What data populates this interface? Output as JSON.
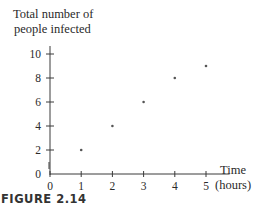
{
  "figure": {
    "caption": "FIGURE 2.14",
    "ylabel_line1": "Total number of",
    "ylabel_line2": "people infected",
    "xlabel_line1": "Time",
    "xlabel_line2": "(hours)"
  },
  "colors": {
    "axis": "#3a3a3a",
    "point": "#555555",
    "text": "#2a2a2a"
  },
  "chart_data": {
    "type": "scatter",
    "title": "",
    "xlabel": "Time (hours)",
    "ylabel": "Total number of people infected",
    "x": [
      1,
      2,
      3,
      4,
      5
    ],
    "y": [
      2,
      4,
      6,
      8,
      9
    ],
    "xticks": [
      0,
      1,
      2,
      3,
      4,
      5
    ],
    "yticks": [
      0,
      2,
      4,
      6,
      8,
      10
    ],
    "xlim": [
      0,
      5.5
    ],
    "ylim": [
      0,
      10.5
    ],
    "grid": false,
    "legend": null,
    "caption": "FIGURE 2.14"
  }
}
